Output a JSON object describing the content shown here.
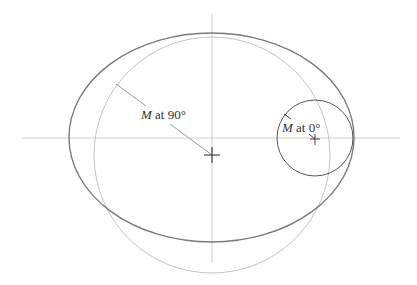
{
  "diagram": {
    "type": "orbit-geometry",
    "colors": {
      "ellipse": "#7a7a7a",
      "large_circle": "#c4c4c4",
      "small_circle": "#555555",
      "axes": "#cfcfcf",
      "radius_lines": "#9a9a9a",
      "cross": "#444444",
      "text": "#333333"
    },
    "labels": {
      "m90": {
        "variable": "M",
        "text": " at 90°"
      },
      "m0": {
        "variable": "M",
        "text": " at 0°"
      }
    },
    "shapes": {
      "ellipse": {
        "cx": 211.5,
        "cy": 137.5,
        "rx": 142.5,
        "ry": 104.5
      },
      "large_circle": {
        "cx": 212,
        "cy": 155,
        "r": 118
      },
      "small_circle": {
        "cx": 315,
        "cy": 138,
        "r": 38
      },
      "center_cross": {
        "x": 212,
        "y": 155
      },
      "focus_cross": {
        "x": 315,
        "y": 139
      }
    }
  }
}
